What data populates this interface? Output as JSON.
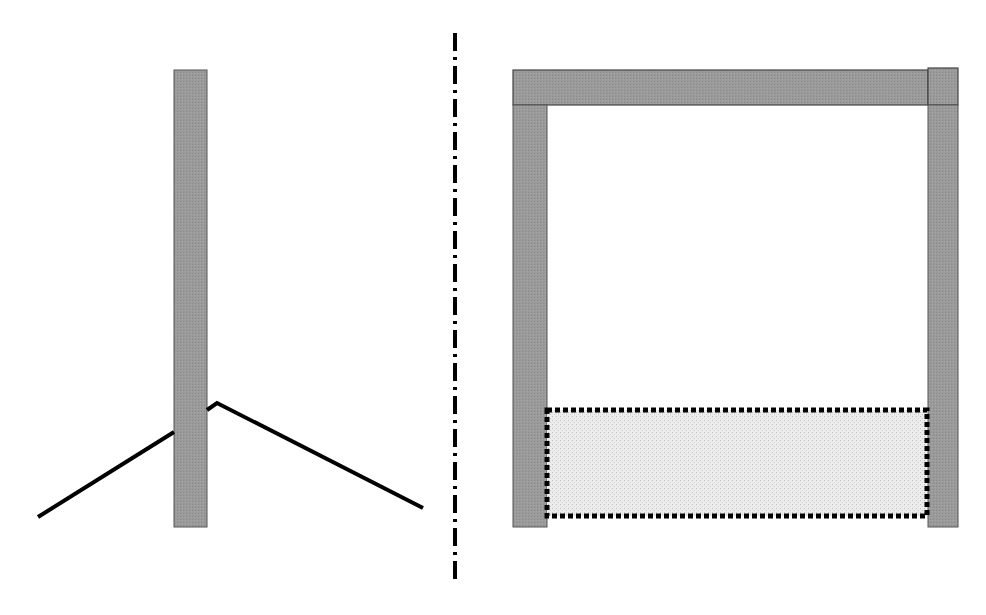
{
  "diagram": {
    "colors": {
      "member_fill": "#9a9a9a",
      "member_stroke": "#555555",
      "line": "#000000",
      "hatch_fill": "#e4e4e4",
      "background": "#ffffff"
    },
    "left_panel": {
      "post": {
        "x": 174,
        "y": 70,
        "width": 33,
        "height": 457
      },
      "angled_line": {
        "left_segment": {
          "x1": 38,
          "y1": 517,
          "x2": 174,
          "y2": 432
        },
        "right_segment_points": "207,410 217,403 423,508"
      }
    },
    "divider": {
      "x": 455,
      "y1": 33,
      "y2": 585
    },
    "right_panel": {
      "top_beam": {
        "x": 513,
        "y": 70,
        "width": 415,
        "height": 35
      },
      "beam_cap": {
        "x": 928,
        "y": 68,
        "width": 30,
        "height": 37
      },
      "left_column": {
        "x": 513,
        "y": 105,
        "width": 34,
        "height": 422
      },
      "right_column": {
        "x": 928,
        "y": 105,
        "width": 30,
        "height": 422
      },
      "dotted_region": {
        "x": 547,
        "y": 410,
        "width": 380,
        "height": 106
      }
    }
  }
}
